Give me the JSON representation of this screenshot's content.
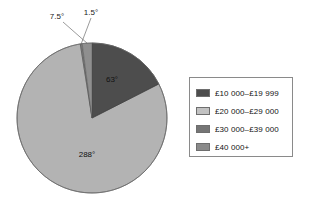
{
  "chart_data": {
    "type": "pie",
    "title": "",
    "subtitle": "",
    "xlabel": "",
    "ylabel": "",
    "units": "degrees",
    "total_degrees": 360,
    "legend_position": "right",
    "grid": false,
    "categories": [
      "£10 000–£19 999",
      "£20 000–£29 000",
      "£30 000–£39 000",
      "£40 000+"
    ],
    "values": [
      63,
      288,
      1.5,
      7.5
    ],
    "value_labels": [
      "63°",
      "288°",
      "1.5°",
      "7.5°"
    ],
    "colors": [
      "#4d4d4d",
      "#b3b3b3",
      "#7a7a7a",
      "#8f8f8f"
    ],
    "slices": [
      {
        "label": "£10 000–£19 999",
        "value": 63,
        "value_label": "63°",
        "color": "#4d4d4d",
        "start_angle": 0,
        "end_angle": 63,
        "label_placement": "inside"
      },
      {
        "label": "£20 000–£29 000",
        "value": 288,
        "value_label": "288°",
        "color": "#b3b3b3",
        "start_angle": 63,
        "end_angle": 351,
        "label_placement": "inside"
      },
      {
        "label": "£30 000–£39 000",
        "value": 1.5,
        "value_label": "1.5°",
        "color": "#7a7a7a",
        "start_angle": 351,
        "end_angle": 352.5,
        "label_placement": "callout"
      },
      {
        "label": "£40 000+",
        "value": 7.5,
        "value_label": "7.5°",
        "color": "#8f8f8f",
        "start_angle": 352.5,
        "end_angle": 360,
        "label_placement": "callout"
      }
    ]
  },
  "pie": {
    "inside_labels": [
      {
        "text": "63°",
        "x": 112,
        "y": 80
      },
      {
        "text": "288°",
        "x": 87,
        "y": 155
      }
    ],
    "callouts": [
      {
        "text": "7.5°",
        "label_x": 57,
        "label_y": 19
      },
      {
        "text": "1.5°",
        "label_x": 91,
        "label_y": 15
      }
    ]
  },
  "legend": {
    "items": [
      {
        "label": "£10 000–£19 999",
        "swatch_color": "#4d4d4d"
      },
      {
        "label": "£20 000–£29 000",
        "swatch_color": "#c2c2c2"
      },
      {
        "label": "£30 000–£39 000",
        "swatch_color": "#757575"
      },
      {
        "label": "£40 000+",
        "swatch_color": "#8a8a8a"
      }
    ]
  }
}
